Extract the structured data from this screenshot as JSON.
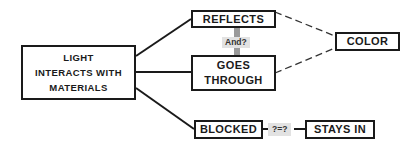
{
  "diagram": {
    "nodes": {
      "main": {
        "lines": [
          "LIGHT",
          "INTERACTS WITH",
          "MATERIALS"
        ]
      },
      "reflects": {
        "label": "REFLECTS"
      },
      "goes_through": {
        "lines": [
          "GOES",
          "THROUGH"
        ]
      },
      "color": {
        "label": "COLOR"
      },
      "blocked": {
        "label": "BLOCKED"
      },
      "stays_in": {
        "label": "STAYS IN"
      }
    },
    "connector_labels": {
      "and": "And?",
      "equals": "?=?"
    },
    "edges": [
      {
        "from": "main",
        "to": "reflects",
        "style": "solid"
      },
      {
        "from": "main",
        "to": "goes_through",
        "style": "solid"
      },
      {
        "from": "main",
        "to": "blocked",
        "style": "solid"
      },
      {
        "from": "reflects",
        "to": "goes_through",
        "style": "grey-bar",
        "label": "And?"
      },
      {
        "from": "reflects",
        "to": "color",
        "style": "dashed"
      },
      {
        "from": "goes_through",
        "to": "color",
        "style": "dashed"
      },
      {
        "from": "blocked",
        "to": "stays_in",
        "style": "solid",
        "label": "?=?"
      }
    ],
    "colors": {
      "stroke": "#1a1a1a",
      "connector_bar": "#9a9a9a",
      "label_bg": "#e2e2e2"
    }
  }
}
